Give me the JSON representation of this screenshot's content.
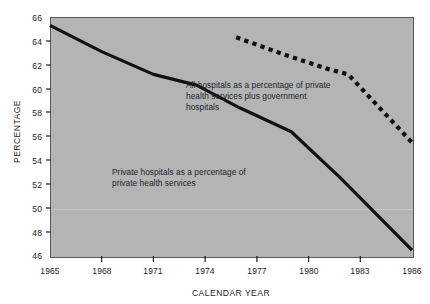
{
  "chart_data": {
    "type": "line",
    "title": "",
    "xlabel": "CALENDAR YEAR",
    "ylabel": "PERCENTAGE",
    "xlim": [
      1965,
      1986
    ],
    "ylim": [
      46,
      66
    ],
    "ytick_labels": [
      "66",
      "64",
      "62",
      "60",
      "58",
      "56",
      "54",
      "52",
      "50",
      "48",
      "46"
    ],
    "ytick_values": [
      66,
      64,
      62,
      60,
      58,
      56,
      54,
      52,
      50,
      48,
      46
    ],
    "xtick_labels": [
      "1965",
      "1968",
      "1971",
      "1974",
      "1977",
      "1980",
      "1983",
      "1986"
    ],
    "xtick_values": [
      1965,
      1968,
      1971,
      1974,
      1977,
      1980,
      1983,
      1986
    ],
    "grid": false,
    "legend_position": "inline-annotations",
    "plot_background_color": "#b4b4b4",
    "series": [
      {
        "name": "Private hospitals as a percentage of private health services",
        "style": "solid",
        "color": "#111111",
        "line_width": 3.2,
        "x": [
          1965,
          1968,
          1971,
          1973.5,
          1976,
          1979,
          1981.8,
          1986
        ],
        "values": [
          65.3,
          63.1,
          61.2,
          60.3,
          58.4,
          56.4,
          52.6,
          46.5
        ]
      },
      {
        "name": "All hospitals as a percentage of private health services plus government hospitals",
        "style": "dotted",
        "color": "#111111",
        "line_width": 4.2,
        "x": [
          1975.8,
          1978.5,
          1981.0,
          1982.3,
          1986
        ],
        "values": [
          64.3,
          62.9,
          61.7,
          61.2,
          55.5
        ]
      }
    ],
    "annotations": [
      {
        "id": "annotation-all-hospitals",
        "text": "All hospitals as a percentage of private\nhealth services plus government\nhospitals",
        "x_px": 186,
        "y_px": 80
      },
      {
        "id": "annotation-private-hospitals",
        "text": "Private hospitals as a percentage of\nprivate health services",
        "x_px": 112,
        "y_px": 167
      }
    ]
  }
}
